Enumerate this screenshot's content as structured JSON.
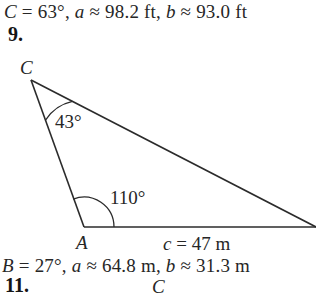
{
  "answers": {
    "top": {
      "parts": [
        {
          "t": "C",
          "i": true
        },
        {
          "t": " = 63°, ",
          "i": false
        },
        {
          "t": "a",
          "i": true
        },
        {
          "t": " ≈ 98.2 ft, ",
          "i": false
        },
        {
          "t": "b",
          "i": true
        },
        {
          "t": " ≈ 93.0 ft",
          "i": false
        }
      ],
      "plain": "C = 63°, a ≈ 98.2 ft, b ≈ 93.0 ft"
    },
    "bottom": {
      "parts": [
        {
          "t": "B",
          "i": true
        },
        {
          "t": " = 27°, ",
          "i": false
        },
        {
          "t": "a",
          "i": true
        },
        {
          "t": " ≈ 64.8 m, ",
          "i": false
        },
        {
          "t": "b",
          "i": true
        },
        {
          "t": " ≈ 31.3 m",
          "i": false
        }
      ],
      "plain": "B = 27°, a ≈ 64.8 m, b ≈ 31.3 m"
    }
  },
  "problems": {
    "number_9": "9.",
    "number_11": "11."
  },
  "figure": {
    "vertex_labels": {
      "C_top": "C",
      "A": "A",
      "C_bottom": "C"
    },
    "angles": {
      "at_C": "43°",
      "at_A": "110°"
    },
    "sides": {
      "c": "c = 47 m"
    },
    "colors": {
      "stroke": "#2b2b2b",
      "text": "#262626",
      "background": "#ffffff"
    },
    "geometry": {
      "C": [
        31,
        80
      ],
      "A": [
        84,
        227
      ],
      "B": [
        316,
        227
      ],
      "baseline_y": 227
    }
  }
}
